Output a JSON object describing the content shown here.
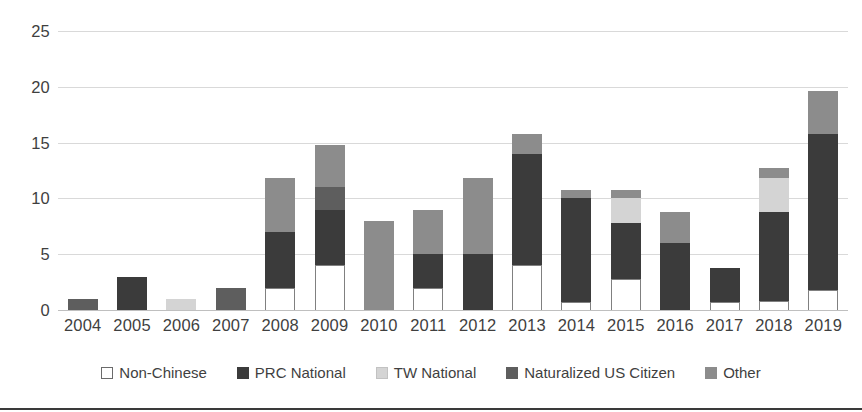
{
  "chart_data": {
    "type": "bar",
    "stacked": true,
    "title": "",
    "subtitle": "",
    "xlabel": "",
    "ylabel": "",
    "ylim": [
      0,
      25
    ],
    "ytick_values": [
      0,
      5,
      10,
      15,
      20,
      25
    ],
    "ytick_labels": [
      "0",
      "5",
      "10",
      "15",
      "20",
      "25"
    ],
    "grid": "horizontal",
    "legend_position": "bottom",
    "categories": [
      "2004",
      "2005",
      "2006",
      "2007",
      "2008",
      "2009",
      "2010",
      "2011",
      "2012",
      "2013",
      "2014",
      "2015",
      "2016",
      "2017",
      "2018",
      "2019"
    ],
    "series": [
      {
        "name": "Non-Chinese",
        "color": "#ffffff",
        "values": [
          0,
          0,
          0,
          0,
          2,
          4,
          0,
          2,
          0,
          4,
          0.7,
          2.8,
          0,
          0.7,
          0.8,
          1.8
        ]
      },
      {
        "name": "PRC National",
        "color": "#3b3b3b",
        "values": [
          0,
          3,
          0,
          0,
          5,
          5,
          0,
          3,
          5,
          10,
          9.3,
          5,
          6,
          3.1,
          8,
          14
        ]
      },
      {
        "name": "TW National",
        "color": "#d4d4d4",
        "values": [
          0,
          0,
          1,
          0,
          0,
          0,
          0,
          0,
          0,
          0,
          0,
          2.2,
          0,
          0,
          3,
          0
        ]
      },
      {
        "name": "Naturalized US Citizen",
        "color": "#5e5e5e",
        "values": [
          1,
          0,
          0,
          2,
          0,
          2,
          0,
          0,
          0,
          0,
          0,
          0,
          0,
          0,
          0,
          0
        ]
      },
      {
        "name": "Other",
        "color": "#8c8c8c",
        "values": [
          0,
          0,
          0,
          0,
          4.8,
          3.8,
          8,
          4,
          6.8,
          1.8,
          0.8,
          0.8,
          2.8,
          0,
          0.9,
          3.8
        ]
      }
    ],
    "totals": [
      1,
      3,
      1,
      2,
      11.8,
      14.8,
      8,
      9,
      11.8,
      15.8,
      10.8,
      10.8,
      8.8,
      3.8,
      12.7,
      19.6
    ]
  }
}
